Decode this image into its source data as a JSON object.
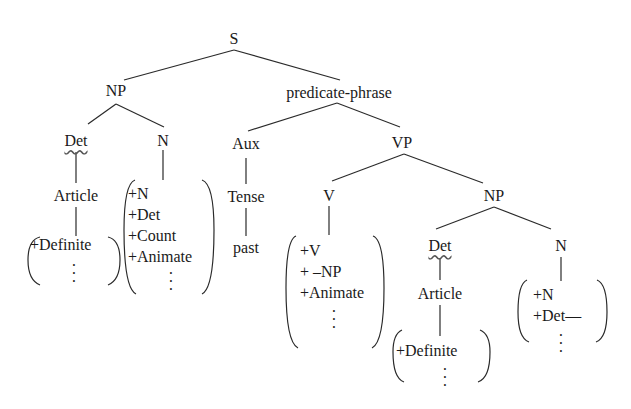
{
  "diagram": {
    "type": "syntax-tree",
    "root": "S",
    "nodes": {
      "s": "S",
      "np1": "NP",
      "pred": "predicate-phrase",
      "det1": "Det",
      "n1": "N",
      "aux": "Aux",
      "vp": "VP",
      "article1": "Article",
      "tense": "Tense",
      "past": "past",
      "v": "V",
      "np2": "NP",
      "det2": "Det",
      "n2": "N",
      "article2": "Article"
    },
    "features": {
      "article1": [
        "+Definite"
      ],
      "n1": [
        "+N",
        "+Det",
        "+Count",
        "+Animate"
      ],
      "v": [
        "+V",
        "+ –NP",
        "+Animate"
      ],
      "article2": [
        "+Definite"
      ],
      "n2": [
        "+N",
        "+Det—"
      ]
    },
    "ellipsis": "⋮"
  }
}
